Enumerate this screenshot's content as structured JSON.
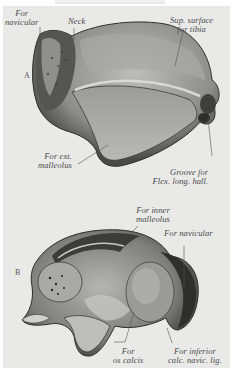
{
  "figure": {
    "panels": [
      {
        "id": "A",
        "marker": "A",
        "labels": [
          {
            "key": "for_navicular",
            "line1": "For",
            "line2": "navicular"
          },
          {
            "key": "neck",
            "line1": "Neck",
            "line2": ""
          },
          {
            "key": "sup_surface",
            "line1": "Sup. surface",
            "line2": "for tibia"
          },
          {
            "key": "ext_malleolus",
            "line1": "For ext.",
            "line2": "malleolus"
          },
          {
            "key": "groove",
            "line1": "Groove for",
            "line2": "Flex. long. hall."
          }
        ]
      },
      {
        "id": "B",
        "marker": "B",
        "labels": [
          {
            "key": "inner_malleolus",
            "line1": "For inner",
            "line2": "malleolus"
          },
          {
            "key": "for_navicular",
            "line1": "For navicular",
            "line2": ""
          },
          {
            "key": "os_calcis",
            "line1": "For",
            "line2": "os calcis"
          },
          {
            "key": "inferior_calc",
            "line1": "For inferior",
            "line2": "calc. navic. lig."
          }
        ]
      }
    ]
  },
  "colors": {
    "paper": "#e9e9e7",
    "ink": "#4a4a4a",
    "bone_light": "#b8b8b6",
    "bone_mid": "#8a8a88",
    "bone_dark": "#3a3a3a"
  }
}
